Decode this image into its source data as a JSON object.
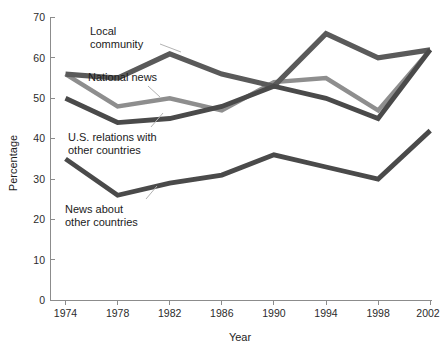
{
  "chart_data": {
    "type": "line",
    "title": "",
    "xlabel": "Year",
    "ylabel": "Percentage",
    "x": [
      1974,
      1978,
      1982,
      1986,
      1990,
      1994,
      1998,
      2002
    ],
    "xtick_labels": [
      "1974",
      "1978",
      "1982",
      "1986",
      "1990",
      "1994",
      "1998",
      "2002"
    ],
    "ytick_labels": [
      "0",
      "10",
      "20",
      "30",
      "40",
      "50",
      "60",
      "70"
    ],
    "yticks": [
      0,
      10,
      20,
      30,
      40,
      50,
      60,
      70
    ],
    "ylim": [
      0,
      70
    ],
    "xlim": [
      1974,
      2002
    ],
    "grid": false,
    "legend": "inline-annotations",
    "series": [
      {
        "name": "Local community",
        "color": "#5a5a5a",
        "values": [
          56,
          55,
          61,
          56,
          53,
          66,
          60,
          62
        ]
      },
      {
        "name": "National news",
        "color": "#8e8e8e",
        "values": [
          56,
          48,
          50,
          47,
          54,
          55,
          47,
          62
        ]
      },
      {
        "name": "U.S. relations with other countries",
        "color": "#4a4a4a",
        "values": [
          50,
          44,
          45,
          48,
          53,
          50,
          45,
          62
        ]
      },
      {
        "name": "News about other countries",
        "color": "#4a4a4a",
        "values": [
          35,
          26,
          29,
          31,
          36,
          33,
          30,
          42
        ]
      }
    ],
    "annotations": [
      {
        "text_line1": "Local",
        "text_line2": "community"
      },
      {
        "text_line1": "National news",
        "text_line2": ""
      },
      {
        "text_line1": "U.S. relations with",
        "text_line2": "other countries"
      },
      {
        "text_line1": "News about",
        "text_line2": "other countries"
      }
    ]
  },
  "axis": {
    "y_title": "Percentage",
    "x_title": "Year",
    "ytick_0": "0",
    "ytick_1": "10",
    "ytick_2": "20",
    "ytick_3": "30",
    "ytick_4": "40",
    "ytick_5": "50",
    "ytick_6": "60",
    "ytick_7": "70",
    "xtick_0": "1974",
    "xtick_1": "1978",
    "xtick_2": "1982",
    "xtick_3": "1986",
    "xtick_4": "1990",
    "xtick_5": "1994",
    "xtick_6": "1998",
    "xtick_7": "2002"
  },
  "labels": {
    "local_community_l1": "Local",
    "local_community_l2": "community",
    "national_news": "National news",
    "us_relations_l1": "U.S. relations with",
    "us_relations_l2": "other countries",
    "news_other_l1": "News about",
    "news_other_l2": "other countries"
  },
  "colors": {
    "series_dark": "#4a4a4a",
    "series_mid_dark": "#5a5a5a",
    "series_mid": "#8e8e8e",
    "axis": "#8c8c8c",
    "text": "#1a1a1a",
    "leader": "#b3b3b3",
    "background": "#ffffff"
  }
}
